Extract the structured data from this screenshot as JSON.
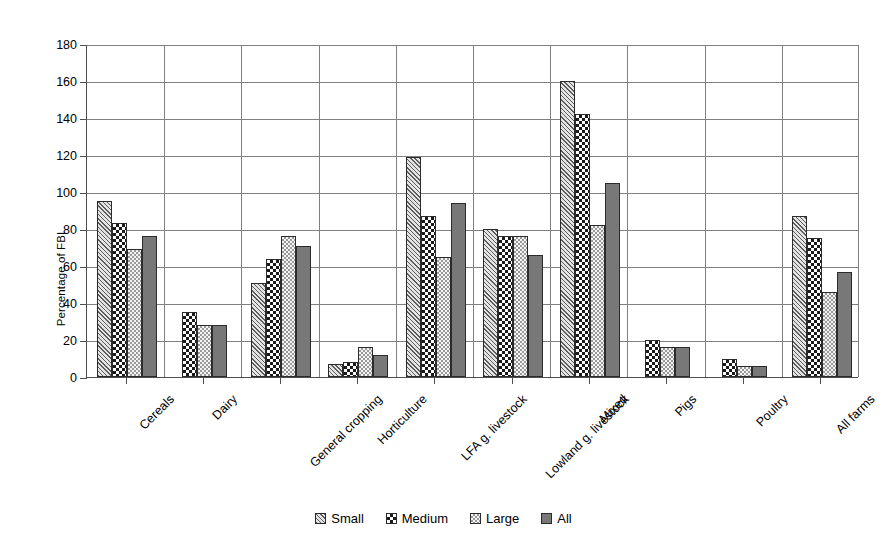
{
  "chart_data": {
    "type": "bar",
    "title": "",
    "xlabel": "",
    "ylabel": "Percentage of FBI",
    "ylim": [
      0,
      180
    ],
    "ytick_step": 20,
    "yticks": [
      0,
      20,
      40,
      60,
      80,
      100,
      120,
      140,
      160,
      180
    ],
    "grid": true,
    "legend_position": "bottom",
    "categories": [
      "Cereals",
      "Dairy",
      "General cropping",
      "Horticulture",
      "LFA g. livestock",
      "Lowland g. livestock",
      "Mixed",
      "Pigs",
      "Poultry",
      "All farms"
    ],
    "series": [
      {
        "name": "Small",
        "pattern": "diagonal-hatch",
        "color": "#c9c9c9",
        "values": [
          95,
          null,
          51,
          7,
          119,
          80,
          160,
          null,
          null,
          87
        ]
      },
      {
        "name": "Medium",
        "pattern": "checkerboard",
        "color": "#1a1a1a",
        "values": [
          83,
          35,
          64,
          8,
          87,
          76,
          142,
          20,
          10,
          75
        ]
      },
      {
        "name": "Large",
        "pattern": "fine-dots",
        "color": "#ededed",
        "values": [
          69,
          28,
          76,
          16,
          65,
          76,
          82,
          16,
          6,
          46
        ]
      },
      {
        "name": "All",
        "pattern": "solid",
        "color": "#787878",
        "values": [
          76,
          28,
          71,
          12,
          94,
          66,
          105,
          16,
          6,
          57
        ]
      }
    ]
  },
  "legend": {
    "items": [
      {
        "label": "Small"
      },
      {
        "label": "Medium"
      },
      {
        "label": "Large"
      },
      {
        "label": "All"
      }
    ]
  }
}
